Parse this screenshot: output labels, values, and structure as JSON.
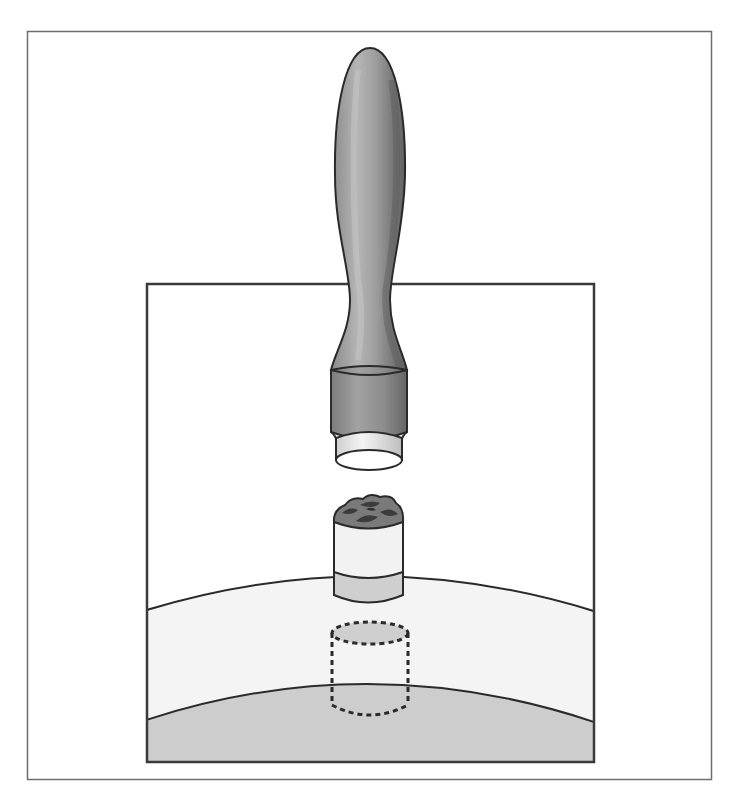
{
  "figure": {
    "colors": {
      "background": "#ffffff",
      "outer_frame": "#6e6e6e",
      "inner_frame": "#3a3a3a",
      "handle_fill": "#9a9a9a",
      "handle_highlight": "#b8b8b8",
      "handle_shadow": "#6f6f6f",
      "ferrule_fill": "#8e8e8e",
      "tip_fill": "#e6e6e6",
      "sample_top": "#7a7a7a",
      "sample_clumps": "#3c3c3c",
      "sample_body": "#f2f2f2",
      "sample_band": "#cfcfcf",
      "upper_layer": "#f4f4f4",
      "lower_layer": "#cdcdcd",
      "outline": "#2a2a2a",
      "dashed_void": "#2a2a2a"
    },
    "parts": [
      {
        "id": "handle",
        "label": "Handle"
      },
      {
        "id": "ferrule",
        "label": "Ferrule"
      },
      {
        "id": "punch-tip",
        "label": "Punch tip"
      },
      {
        "id": "core-sample",
        "label": "Core sample"
      },
      {
        "id": "upper-layer",
        "label": "Upper layer"
      },
      {
        "id": "lower-layer",
        "label": "Lower layer"
      },
      {
        "id": "sample-void",
        "label": "Void left by sample"
      }
    ]
  }
}
